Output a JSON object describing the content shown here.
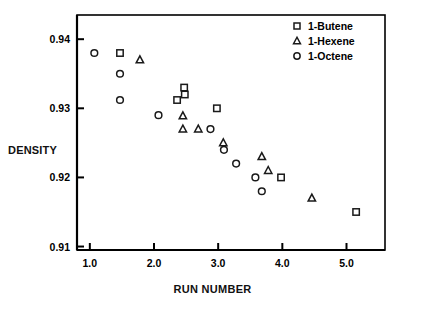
{
  "chart_data": {
    "type": "scatter",
    "title": "",
    "xlabel": "RUN NUMBER",
    "ylabel": "DENSITY",
    "xlim": [
      0.8,
      5.6
    ],
    "ylim": [
      0.9095,
      0.9435
    ],
    "xticks": [
      "1.0",
      "2.0",
      "3.0",
      "4.0",
      "5.0"
    ],
    "xtick_values": [
      1.0,
      2.0,
      3.0,
      4.0,
      5.0
    ],
    "yticks": [
      "0.91",
      "0.92",
      "0.93",
      "0.94"
    ],
    "ytick_values": [
      0.91,
      0.92,
      0.93,
      0.94
    ],
    "grid": false,
    "legend_position": "top-right",
    "frame": true,
    "series": [
      {
        "name": "1-Butene",
        "marker": "square",
        "points": [
          {
            "x": 1.47,
            "y": 0.938
          },
          {
            "x": 2.36,
            "y": 0.9312
          },
          {
            "x": 2.47,
            "y": 0.933
          },
          {
            "x": 2.48,
            "y": 0.932
          },
          {
            "x": 2.98,
            "y": 0.93
          },
          {
            "x": 3.98,
            "y": 0.92
          },
          {
            "x": 5.15,
            "y": 0.915
          }
        ]
      },
      {
        "name": "1-Hexene",
        "marker": "triangle",
        "points": [
          {
            "x": 1.78,
            "y": 0.937
          },
          {
            "x": 2.45,
            "y": 0.9289
          },
          {
            "x": 2.45,
            "y": 0.927
          },
          {
            "x": 2.69,
            "y": 0.927
          },
          {
            "x": 3.08,
            "y": 0.925
          },
          {
            "x": 3.68,
            "y": 0.923
          },
          {
            "x": 3.78,
            "y": 0.921
          },
          {
            "x": 4.46,
            "y": 0.917
          }
        ]
      },
      {
        "name": "1-Octene",
        "marker": "circle",
        "points": [
          {
            "x": 1.07,
            "y": 0.938
          },
          {
            "x": 1.47,
            "y": 0.935
          },
          {
            "x": 1.47,
            "y": 0.9312
          },
          {
            "x": 2.07,
            "y": 0.929
          },
          {
            "x": 2.88,
            "y": 0.927
          },
          {
            "x": 3.09,
            "y": 0.924
          },
          {
            "x": 3.28,
            "y": 0.922
          },
          {
            "x": 3.58,
            "y": 0.92
          },
          {
            "x": 3.68,
            "y": 0.918
          }
        ]
      }
    ]
  },
  "legend": {
    "entries": [
      {
        "label": "1-Butene",
        "marker": "square"
      },
      {
        "label": "1-Hexene",
        "marker": "triangle"
      },
      {
        "label": "1-Octene",
        "marker": "circle"
      }
    ]
  },
  "colors": {
    "axis": "#000000",
    "marker_stroke": "#1a1a1a",
    "background": "#ffffff",
    "text": "#000000"
  }
}
